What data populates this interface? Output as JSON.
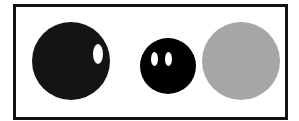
{
  "figure": {
    "colors": {
      "frame": "#111111",
      "background": "#ffffff",
      "dark_circle": "#141414",
      "eye": "#ffffff",
      "gray_circle": "#a6a6a6"
    },
    "shapes": [
      {
        "name": "large-black-circle",
        "color": "#141414",
        "cx": 71,
        "cy": 61,
        "r": 39,
        "eyes": [
          {
            "cx": 98,
            "cy": 54,
            "rx": 5,
            "ry": 10
          }
        ]
      },
      {
        "name": "small-black-circle-with-eyes",
        "color": "#000000",
        "cx": 168,
        "cy": 66,
        "r": 28,
        "eyes": [
          {
            "cx": 154.5,
            "cy": 59,
            "rx": 3.5,
            "ry": 7
          },
          {
            "cx": 168.5,
            "cy": 59,
            "rx": 3.5,
            "ry": 7
          }
        ]
      },
      {
        "name": "gray-circle",
        "color": "#a6a6a6",
        "cx": 241,
        "cy": 61,
        "r": 39,
        "eyes": []
      }
    ]
  }
}
